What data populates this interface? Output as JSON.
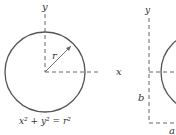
{
  "left_figure": {
    "y_axis_label": "y",
    "x_axis_label": "x",
    "radius_label": "r",
    "equation": "x² + y² = r²"
  },
  "right_figure": {
    "y_axis_label": "y",
    "offset_y_label": "b",
    "offset_x_label": "a"
  },
  "colors": {
    "stroke": "#555555",
    "axis": "#666666",
    "text": "#333333"
  }
}
